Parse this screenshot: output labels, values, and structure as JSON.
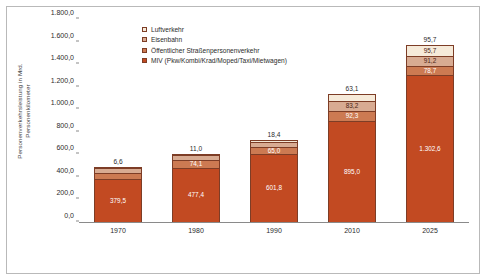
{
  "chart_data": {
    "type": "bar",
    "stacked": true,
    "title": "",
    "xlabel": "",
    "ylabel": "Personenverkehrsleistung in Mrd. Personenkilometer",
    "ylim": [
      0,
      1800
    ],
    "ytick_labels": [
      "1.800,0",
      "1.600,0",
      "1.400,0",
      "1.200,0",
      "1.000,0",
      "800,0",
      "600,0",
      "400,0",
      "200,0",
      "0,0"
    ],
    "ytick_values": [
      1800,
      1600,
      1400,
      1200,
      1000,
      800,
      600,
      400,
      200,
      0
    ],
    "grid": false,
    "legend_position": "top-center",
    "categories": [
      "1970",
      "1980",
      "1990",
      "2010",
      "2025"
    ],
    "series": [
      {
        "name": "MIV (Pkw/Kombi/Krad/Moped/Taxi/Mietwagen)",
        "color": "#c24a22",
        "values": [
          379.5,
          477.4,
          601.8,
          895.0,
          1302.6
        ],
        "labels": [
          "379,5",
          "477,4",
          "601,8",
          "895,0",
          "1.302,6"
        ]
      },
      {
        "name": "Öffentlicher Straßenpersonenverkehr",
        "color": "#cc7a52",
        "values": [
          58.4,
          74.1,
          65.0,
          92.3,
          78.7
        ],
        "labels": [
          "58,4",
          "74,1",
          "65,0",
          "92,3",
          "78,7"
        ]
      },
      {
        "name": "Eisenbahn",
        "color": "#d8ab92",
        "values": [
          37.2,
          41.6,
          44.6,
          83.2,
          91.2
        ],
        "labels": [
          "37,2",
          "41,6",
          "44,6",
          "83,2",
          "91,2"
        ]
      },
      {
        "name": "Luftverkehr",
        "color": "#f6ead9",
        "values": [
          6.6,
          11.0,
          18.4,
          63.1,
          95.7
        ],
        "labels": [
          "6,6",
          "11,0",
          "18,4",
          "63,1",
          "95,7"
        ]
      }
    ],
    "top_labels": [
      "6,6",
      "11,0",
      "18,4",
      "63,1",
      "95,7"
    ],
    "legend_entries": [
      {
        "label": "Luftverkehr",
        "color": "#f6ead9"
      },
      {
        "label": "Eisenbahn",
        "color": "#d8ab92"
      },
      {
        "label": "Öffentlicher Straßenpersonenverkehr",
        "color": "#cc7a52"
      },
      {
        "label": "MIV (Pkw/Kombi/Krad/Moped/Taxi/Mietwagen)",
        "color": "#c24a22"
      }
    ],
    "colors": {
      "miv": "#c24a22",
      "oespv": "#cc7a52",
      "eisenbahn": "#d8ab92",
      "luftverkehr": "#f6ead9",
      "border": "#7d3d26",
      "axis": "#8a8a8a",
      "frame": "#b9b9b9"
    }
  }
}
